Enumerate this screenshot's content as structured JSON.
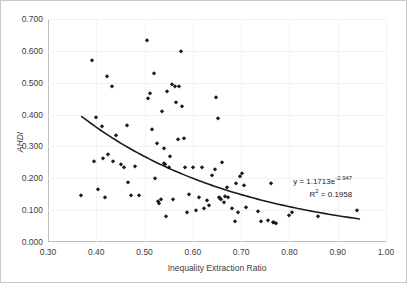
{
  "chart_data": {
    "type": "scatter",
    "title": "",
    "xlabel": "Inequality Extraction Ratio",
    "ylabel": "AHDI",
    "xlim": [
      0.3,
      1.0
    ],
    "ylim": [
      0.0,
      0.7
    ],
    "xticks": [
      "0.30",
      "0.40",
      "0.50",
      "0.60",
      "0.70",
      "0.80",
      "0.90",
      "1.00"
    ],
    "xtick_values": [
      0.3,
      0.4,
      0.5,
      0.6,
      0.7,
      0.8,
      0.9,
      1.0
    ],
    "yticks": [
      "0.000",
      "0.100",
      "0.200",
      "0.300",
      "0.400",
      "0.500",
      "0.600",
      "0.700"
    ],
    "ytick_values": [
      0.0,
      0.1,
      0.2,
      0.3,
      0.4,
      0.5,
      0.6,
      0.7
    ],
    "grid": true,
    "legend": "none",
    "marker_color": "#1b1b1b",
    "trendline_color": "#1b1b1b",
    "trendline": {
      "type": "exponential",
      "coefficient": 1.1713,
      "exponent": -2.947,
      "r_squared": 0.1958,
      "x_start": 0.37,
      "x_end": 0.945
    },
    "annotation": {
      "equation_prefix": "y = 1.1713e",
      "equation_exponent": "-2.947",
      "r_squared_label": "R",
      "r_squared_sup": "2",
      "r_squared_value": " = 0.1958"
    },
    "points": [
      [
        0.368,
        0.146
      ],
      [
        0.392,
        0.57
      ],
      [
        0.395,
        0.255
      ],
      [
        0.4,
        0.392
      ],
      [
        0.403,
        0.167
      ],
      [
        0.412,
        0.365
      ],
      [
        0.414,
        0.263
      ],
      [
        0.418,
        0.141
      ],
      [
        0.423,
        0.522
      ],
      [
        0.424,
        0.277
      ],
      [
        0.432,
        0.49
      ],
      [
        0.434,
        0.253
      ],
      [
        0.441,
        0.335
      ],
      [
        0.452,
        0.246
      ],
      [
        0.458,
        0.236
      ],
      [
        0.463,
        0.366
      ],
      [
        0.466,
        0.188
      ],
      [
        0.472,
        0.149
      ],
      [
        0.48,
        0.237
      ],
      [
        0.488,
        0.148
      ],
      [
        0.505,
        0.633
      ],
      [
        0.508,
        0.451
      ],
      [
        0.512,
        0.468
      ],
      [
        0.515,
        0.355
      ],
      [
        0.519,
        0.531
      ],
      [
        0.522,
        0.202
      ],
      [
        0.525,
        0.31
      ],
      [
        0.527,
        0.128
      ],
      [
        0.53,
        0.122
      ],
      [
        0.534,
        0.135
      ],
      [
        0.537,
        0.412
      ],
      [
        0.54,
        0.295
      ],
      [
        0.541,
        0.248
      ],
      [
        0.543,
        0.244
      ],
      [
        0.545,
        0.083
      ],
      [
        0.547,
        0.475
      ],
      [
        0.551,
        0.236
      ],
      [
        0.553,
        0.27
      ],
      [
        0.556,
        0.497
      ],
      [
        0.558,
        0.136
      ],
      [
        0.562,
        0.489
      ],
      [
        0.566,
        0.441
      ],
      [
        0.569,
        0.322
      ],
      [
        0.572,
        0.489
      ],
      [
        0.575,
        0.598
      ],
      [
        0.578,
        0.427
      ],
      [
        0.581,
        0.326
      ],
      [
        0.584,
        0.235
      ],
      [
        0.587,
        0.093
      ],
      [
        0.592,
        0.15
      ],
      [
        0.6,
        0.236
      ],
      [
        0.606,
        0.099
      ],
      [
        0.612,
        0.141
      ],
      [
        0.618,
        0.236
      ],
      [
        0.624,
        0.106
      ],
      [
        0.63,
        0.133
      ],
      [
        0.634,
        0.117
      ],
      [
        0.64,
        0.209
      ],
      [
        0.645,
        0.23
      ],
      [
        0.648,
        0.455
      ],
      [
        0.652,
        0.388
      ],
      [
        0.655,
        0.14
      ],
      [
        0.657,
        0.137
      ],
      [
        0.659,
        0.136
      ],
      [
        0.661,
        0.251
      ],
      [
        0.664,
        0.126
      ],
      [
        0.667,
        0.145
      ],
      [
        0.67,
        0.173
      ],
      [
        0.673,
        0.141
      ],
      [
        0.681,
        0.106
      ],
      [
        0.687,
        0.065
      ],
      [
        0.69,
        0.185
      ],
      [
        0.693,
        0.093
      ],
      [
        0.697,
        0.206
      ],
      [
        0.701,
        0.216
      ],
      [
        0.705,
        0.18
      ],
      [
        0.71,
        0.109
      ],
      [
        0.735,
        0.097
      ],
      [
        0.742,
        0.066
      ],
      [
        0.756,
        0.07
      ],
      [
        0.762,
        0.185
      ],
      [
        0.766,
        0.063
      ],
      [
        0.769,
        0.062
      ],
      [
        0.772,
        0.059
      ],
      [
        0.8,
        0.086
      ],
      [
        0.806,
        0.094
      ],
      [
        0.86,
        0.081
      ],
      [
        0.94,
        0.099
      ]
    ]
  }
}
